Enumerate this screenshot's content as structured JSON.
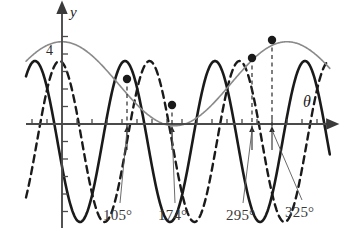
{
  "figure": {
    "title": "",
    "background_color": "#ffffff"
  },
  "axes": {
    "y_axis_label": "y",
    "x_axis_label": "θ",
    "y_tick_label": "4",
    "origin_px": {
      "x": 62,
      "y": 124
    },
    "x_units_per_px": 1.0,
    "y_px_per_unit": 17.5,
    "x_axis_arrow": true,
    "y_axis_arrow": true,
    "x_tick_spacing_px": 15,
    "y_tick_spacing_px": 17.5
  },
  "labels": {
    "angles": [
      {
        "text": "105°",
        "x": 103,
        "y": 207,
        "target_x": 127,
        "target_y": 130
      },
      {
        "text": "174°",
        "x": 158,
        "y": 207,
        "target_x": 172,
        "target_y": 130
      },
      {
        "text": "295°",
        "x": 226,
        "y": 207,
        "target_x": 252,
        "target_y": 130
      },
      {
        "text": "325°",
        "x": 285,
        "y": 204,
        "target_x": 272,
        "target_y": 130
      }
    ]
  },
  "chart_data": {
    "type": "line",
    "title": "",
    "xlabel": "θ",
    "ylabel": "y",
    "xlim": [
      -20,
      340
    ],
    "ylim": [
      -6.5,
      5.2
    ],
    "grid": false,
    "legend": false,
    "tick_labels": {
      "y": [
        "4"
      ]
    },
    "annotations": [
      "105°",
      "174°",
      "295°",
      "325°"
    ],
    "series": [
      {
        "name": "solid-thick-curve",
        "style": "solid",
        "color": "#1a1a1a",
        "width": 2.6,
        "form": "sinusoid",
        "amplitude": 4.6,
        "period_px": 90,
        "phase_deg": 108,
        "offset": -1.0,
        "description": "High-frequency solid black wave"
      },
      {
        "name": "dashed-curve",
        "style": "dashed",
        "color": "#1a1a1a",
        "width": 2.4,
        "form": "sinusoid",
        "amplitude": 4.6,
        "period_px": 90,
        "phase_deg": 10,
        "offset": -1.0,
        "description": "High-frequency dashed black wave, phase shifted"
      },
      {
        "name": "gray-slow-curve",
        "style": "solid",
        "color": "#8a8a8a",
        "width": 1.6,
        "form": "sinusoid",
        "amplitude": 2.4,
        "period_px": 225,
        "phase_deg": 0,
        "offset": 2.3,
        "description": "Low-frequency thin gray wave"
      }
    ],
    "marked_points": [
      {
        "label": "105°",
        "x_px": 127,
        "y_px": 79
      },
      {
        "label": "174°",
        "x_px": 172,
        "y_px": 105
      },
      {
        "label": "295°",
        "x_px": 252,
        "y_px": 58
      },
      {
        "label": "325°",
        "x_px": 272,
        "y_px": 40
      }
    ],
    "droplines": [
      {
        "x_px": 127,
        "from_y_px": 79,
        "to_y_px": 128
      },
      {
        "x_px": 172,
        "from_y_px": 105,
        "to_y_px": 128
      },
      {
        "x_px": 252,
        "from_y_px": 58,
        "to_y_px": 128
      },
      {
        "x_px": 272,
        "from_y_px": 40,
        "to_y_px": 128
      }
    ]
  }
}
